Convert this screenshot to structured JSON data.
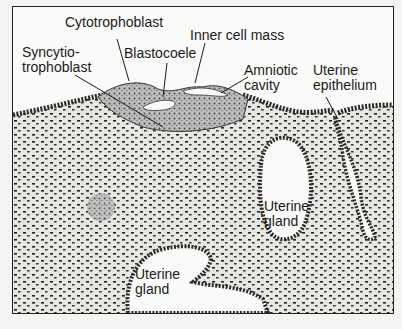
{
  "diagram": {
    "labels": [
      {
        "id": "cytotrophoblast",
        "lines": [
          "Cytotrophoblast"
        ]
      },
      {
        "id": "inner-cell-mass",
        "lines": [
          "Inner cell mass"
        ]
      },
      {
        "id": "syncytiotrophoblast",
        "lines": [
          "Syncytio-",
          "trophoblast"
        ]
      },
      {
        "id": "blastocoele",
        "lines": [
          "Blastocoele"
        ]
      },
      {
        "id": "amniotic-cavity",
        "lines": [
          "Amniotic",
          "cavity"
        ]
      },
      {
        "id": "uterine-epithelium",
        "lines": [
          "Uterine",
          "epithelium"
        ]
      },
      {
        "id": "uterine-gland-right",
        "lines": [
          "Uterine",
          "gland"
        ]
      },
      {
        "id": "uterine-gland-bottom",
        "lines": [
          "Uterine",
          "gland"
        ]
      }
    ]
  }
}
